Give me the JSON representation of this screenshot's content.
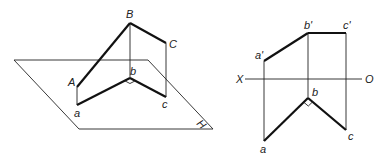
{
  "figures": {
    "pictorial": {
      "plane": {
        "points": [
          [
            14,
            60
          ],
          [
            148,
            60
          ],
          [
            213,
            129
          ],
          [
            79,
            129
          ]
        ],
        "label": "H",
        "label_pos": [
          196,
          124
        ],
        "label_rotate": 45
      },
      "points": {
        "A": {
          "xy": [
            77,
            87
          ],
          "label": "A",
          "label_pos": [
            68,
            86
          ]
        },
        "B": {
          "xy": [
            130,
            23
          ],
          "label": "B",
          "label_pos": [
            126,
            18
          ]
        },
        "C": {
          "xy": [
            166,
            43
          ],
          "label": "C",
          "label_pos": [
            169,
            48
          ]
        },
        "a": {
          "xy": [
            77,
            105
          ],
          "label": "a",
          "label_pos": [
            74,
            117
          ]
        },
        "b": {
          "xy": [
            130,
            78
          ],
          "label": "b",
          "label_pos": [
            130,
            75
          ]
        },
        "c": {
          "xy": [
            166,
            97
          ],
          "label": "c",
          "label_pos": [
            162,
            108
          ]
        }
      },
      "thick_lines": [
        [
          "A",
          "B"
        ],
        [
          "B",
          "C"
        ],
        [
          "a",
          "b"
        ],
        [
          "b",
          "c"
        ]
      ],
      "thin_lines": [
        [
          "A",
          "a"
        ],
        [
          "B",
          "b"
        ],
        [
          "C",
          "c"
        ]
      ],
      "right_angle_at": "b"
    },
    "orthographic": {
      "axis": {
        "y": 79,
        "x1": 245,
        "x2": 362,
        "left_label": "X",
        "left_label_pos": [
          236,
          83
        ],
        "right_label": "O",
        "right_label_pos": [
          365,
          83
        ]
      },
      "points": {
        "a_prime": {
          "xy": [
            264,
            61
          ],
          "label": "a'",
          "label_pos": [
            255,
            59
          ]
        },
        "b_prime": {
          "xy": [
            308,
            33
          ],
          "label": "b'",
          "label_pos": [
            304,
            29
          ]
        },
        "c_prime": {
          "xy": [
            346,
            33
          ],
          "label": "c'",
          "label_pos": [
            343,
            29
          ]
        },
        "a": {
          "xy": [
            264,
            141
          ],
          "label": "a",
          "label_pos": [
            260,
            153
          ]
        },
        "b": {
          "xy": [
            308,
            98
          ],
          "label": "b",
          "label_pos": [
            312,
            96
          ]
        },
        "c": {
          "xy": [
            346,
            130
          ],
          "label": "c",
          "label_pos": [
            348,
            140
          ]
        }
      },
      "thick_lines": [
        [
          "a_prime",
          "b_prime"
        ],
        [
          "b_prime",
          "c_prime"
        ],
        [
          "a",
          "b"
        ],
        [
          "b",
          "c"
        ]
      ],
      "thin_lines": [
        [
          "a_prime",
          "a"
        ],
        [
          "b_prime",
          "b"
        ],
        [
          "c_prime",
          "c"
        ]
      ],
      "right_angle_at": "b"
    }
  }
}
